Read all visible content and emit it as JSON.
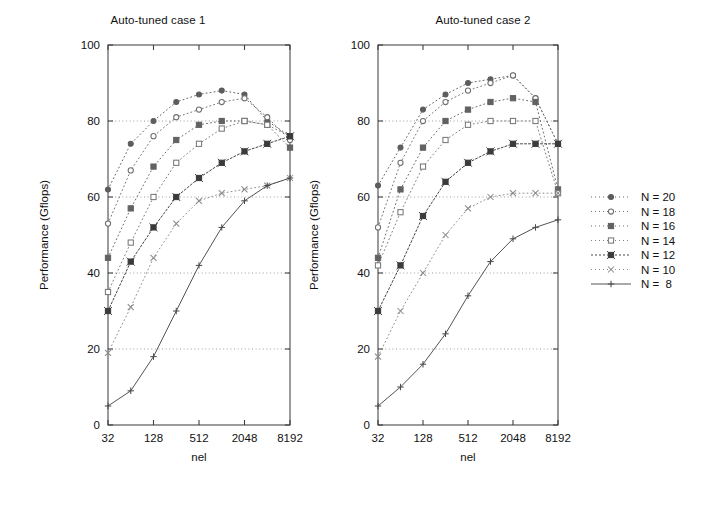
{
  "figure": {
    "width": 720,
    "height": 512,
    "background": "#ffffff"
  },
  "legend": {
    "name": "series-legend",
    "entries": [
      {
        "label": "N = 20",
        "marker": "filled-circle",
        "dash": "1 3",
        "color": "#5d5d5d"
      },
      {
        "label": "N = 18",
        "marker": "open-circle",
        "dash": "1 3",
        "color": "#6e6e6e"
      },
      {
        "label": "N = 16",
        "marker": "filled-square",
        "dash": "1 3",
        "color": "#626262"
      },
      {
        "label": "N = 14",
        "marker": "open-square",
        "dash": "1 3",
        "color": "#787878"
      },
      {
        "label": "N = 12",
        "marker": "filled-square-x",
        "dash": "2 2",
        "color": "#3b3b3b"
      },
      {
        "label": "N = 10",
        "marker": "cross-x",
        "dash": "1 3",
        "color": "#8a8a8a"
      },
      {
        "label": "N =  8",
        "marker": "plus",
        "dash": "none",
        "color": "#4a4a4a"
      }
    ]
  },
  "chart_data": [
    {
      "type": "line",
      "panel_id": "auto-tuned-case-1",
      "title": "Auto-tuned case 1",
      "xlabel": "nel",
      "ylabel": "Performance (Gflops)",
      "xscale": "log4",
      "x": [
        32,
        64,
        128,
        256,
        512,
        1024,
        2048,
        4096,
        8192
      ],
      "xticks": [
        32,
        128,
        512,
        2048,
        8192
      ],
      "xticklabels": [
        "32",
        "128",
        "512",
        "2048",
        "8192"
      ],
      "yticks": [
        0,
        20,
        40,
        60,
        80,
        100
      ],
      "yticklabels": [
        "0",
        "20",
        "40",
        "60",
        "80",
        "100"
      ],
      "ylim": [
        0,
        100
      ],
      "grid": true,
      "gridlines_y": [
        20,
        40,
        60,
        80
      ],
      "legend_position": "outside-right",
      "series": [
        {
          "name": "N = 20",
          "values": [
            62,
            74,
            80,
            85,
            87,
            88,
            87,
            80,
            76
          ]
        },
        {
          "name": "N = 18",
          "values": [
            53,
            67,
            76,
            81,
            83,
            85,
            86,
            81,
            75
          ]
        },
        {
          "name": "N = 16",
          "values": [
            44,
            57,
            68,
            75,
            79,
            80,
            80,
            79,
            73
          ]
        },
        {
          "name": "N = 14",
          "values": [
            35,
            48,
            60,
            69,
            74,
            78,
            80,
            79,
            76
          ]
        },
        {
          "name": "N = 12",
          "values": [
            30,
            43,
            52,
            60,
            65,
            69,
            72,
            74,
            76
          ]
        },
        {
          "name": "N = 10",
          "values": [
            19,
            31,
            44,
            53,
            59,
            61,
            62,
            63,
            65
          ]
        },
        {
          "name": "N =  8",
          "values": [
            5,
            9,
            18,
            30,
            42,
            52,
            59,
            63,
            65
          ]
        }
      ]
    },
    {
      "type": "line",
      "panel_id": "auto-tuned-case-2",
      "title": "Auto-tuned case 2",
      "xlabel": "nel",
      "ylabel": "Performance (Gflops)",
      "xscale": "log4",
      "x": [
        32,
        64,
        128,
        256,
        512,
        1024,
        2048,
        4096,
        8192
      ],
      "xticks": [
        32,
        128,
        512,
        2048,
        8192
      ],
      "xticklabels": [
        "32",
        "128",
        "512",
        "2048",
        "8192"
      ],
      "yticks": [
        0,
        20,
        40,
        60,
        80,
        100
      ],
      "yticklabels": [
        "0",
        "20",
        "40",
        "60",
        "80",
        "100"
      ],
      "ylim": [
        0,
        100
      ],
      "grid": true,
      "gridlines_y": [
        20,
        40,
        60,
        80
      ],
      "legend_position": "outside-right",
      "series": [
        {
          "name": "N = 20",
          "values": [
            63,
            73,
            83,
            87,
            90,
            91,
            92,
            86,
            74
          ]
        },
        {
          "name": "N = 18",
          "values": [
            52,
            69,
            80,
            85,
            88,
            90,
            92,
            86,
            74
          ]
        },
        {
          "name": "N = 16",
          "values": [
            44,
            62,
            73,
            80,
            83,
            85,
            86,
            85,
            62
          ]
        },
        {
          "name": "N = 14",
          "values": [
            42,
            56,
            68,
            75,
            79,
            80,
            80,
            80,
            61
          ]
        },
        {
          "name": "N = 12",
          "values": [
            30,
            42,
            55,
            64,
            69,
            72,
            74,
            74,
            74
          ]
        },
        {
          "name": "N = 10",
          "values": [
            18,
            30,
            40,
            50,
            57,
            60,
            61,
            61,
            61
          ]
        },
        {
          "name": "N =  8",
          "values": [
            5,
            10,
            16,
            24,
            34,
            43,
            49,
            52,
            54
          ]
        }
      ]
    }
  ]
}
